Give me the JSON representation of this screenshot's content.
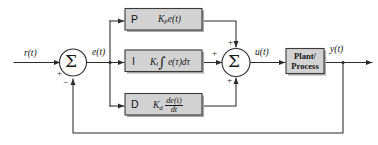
{
  "diagram": {
    "type": "control-system-block-diagram",
    "background_color": "#ffffff",
    "block_fill_color": "#d2d2d2",
    "line_color": "#2b2b2b"
  },
  "signals": {
    "reference": "r(t)",
    "error": "e(t)",
    "control": "u(t)",
    "output": "y(t)"
  },
  "summing_junctions": [
    {
      "id": "error-sum",
      "symbol": "Σ",
      "signs": {
        "left": "+",
        "bottom": "−"
      }
    },
    {
      "id": "control-sum",
      "symbol": "Σ",
      "signs": {
        "top": "+",
        "left": "+",
        "bottom": "+"
      }
    }
  ],
  "blocks": {
    "proportional": {
      "letter": "P",
      "gain": "K",
      "gain_subscript": "p",
      "expression": "e(t)",
      "full_expression": "K_p e(t)"
    },
    "integral": {
      "letter": "I",
      "gain": "K",
      "gain_subscript": "i",
      "integral_symbol": "∫",
      "expression": "e(τ)dτ",
      "full_expression": "K_i ∫ e(τ)dτ"
    },
    "derivative": {
      "letter": "D",
      "gain": "K",
      "gain_subscript": "d",
      "numerator": "de(t)",
      "denominator": "dt",
      "full_expression": "K_d de(t)/dt"
    },
    "plant": {
      "line1": "Plant/",
      "line2": "Process"
    }
  }
}
